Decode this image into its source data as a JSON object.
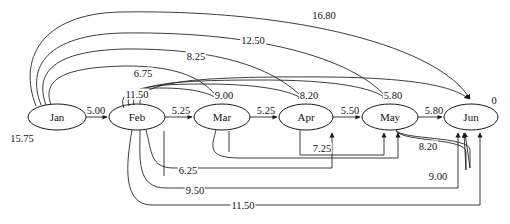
{
  "diagram": {
    "nodes": [
      {
        "id": "jan",
        "label": "Jan",
        "cx": 57,
        "cy": 117,
        "rx": 29,
        "ry": 13
      },
      {
        "id": "feb",
        "label": "Feb",
        "cx": 137,
        "cy": 117,
        "rx": 28,
        "ry": 13
      },
      {
        "id": "mar",
        "label": "Mar",
        "cx": 222,
        "cy": 117,
        "rx": 28,
        "ry": 13
      },
      {
        "id": "apr",
        "label": "Apr",
        "cx": 306,
        "cy": 117,
        "rx": 27,
        "ry": 13
      },
      {
        "id": "may",
        "label": "May",
        "cx": 390,
        "cy": 117,
        "rx": 28,
        "ry": 13
      },
      {
        "id": "jun",
        "label": "Jun",
        "cx": 471,
        "cy": 117,
        "rx": 27,
        "ry": 13
      }
    ],
    "chain_edges": [
      {
        "from": "jan",
        "to": "feb",
        "value": "5.00",
        "lx": 96,
        "ly": 110
      },
      {
        "from": "feb",
        "to": "mar",
        "value": "5.25",
        "lx": 181,
        "ly": 110
      },
      {
        "from": "mar",
        "to": "apr",
        "value": "5.25",
        "lx": 266,
        "ly": 110
      },
      {
        "from": "apr",
        "to": "may",
        "value": "5.50",
        "lx": 350,
        "ly": 110
      },
      {
        "from": "may",
        "to": "jun",
        "value": "5.80",
        "lx": 434,
        "ly": 110
      }
    ],
    "upper_arcs": [
      {
        "from": "jan",
        "to": "jun",
        "value": "16.80",
        "lx": 324,
        "ly": 15
      },
      {
        "from": "jan",
        "to": "may",
        "value": "12.50",
        "lx": 253,
        "ly": 40
      },
      {
        "from": "jan",
        "to": "apr",
        "value": "8.25",
        "lx": 196,
        "ly": 56
      },
      {
        "from": "jan",
        "to": "mar",
        "value": "6.75",
        "lx": 143,
        "ly": 73
      },
      {
        "from": "feb",
        "to": "mar",
        "value": "11.50",
        "lx": 137,
        "ly": 94
      },
      {
        "from": "feb",
        "to": "apr",
        "value": "9.00",
        "lx": 224,
        "ly": 95
      },
      {
        "from": "feb",
        "to": "may",
        "value": "8.20",
        "lx": 309,
        "ly": 95
      },
      {
        "from": "feb",
        "to": "jun",
        "value": "5.80",
        "lx": 393,
        "ly": 95
      }
    ],
    "lower_arcs": [
      {
        "from": "apr",
        "to": "may",
        "value": "7.25",
        "lx": 322,
        "ly": 148
      },
      {
        "from": "may",
        "to": "jun",
        "value": "8.20",
        "lx": 428,
        "ly": 146
      },
      {
        "from": "mar",
        "to": "jun",
        "value": "9.00",
        "lx": 438,
        "ly": 176
      },
      {
        "from": "feb",
        "to": "may",
        "value": "6.25",
        "lx": 188,
        "ly": 170
      },
      {
        "from": "feb",
        "to": "jun",
        "value": "9.50",
        "lx": 195,
        "ly": 190
      },
      {
        "from": "feb",
        "to": "jun",
        "value": "11.50",
        "lx": 243,
        "ly": 205
      }
    ],
    "annotations": [
      {
        "id": "source-supply",
        "value": "15.75",
        "lx": 22,
        "ly": 138
      },
      {
        "id": "sink-balance",
        "value": "0",
        "lx": 494,
        "ly": 100
      }
    ]
  }
}
